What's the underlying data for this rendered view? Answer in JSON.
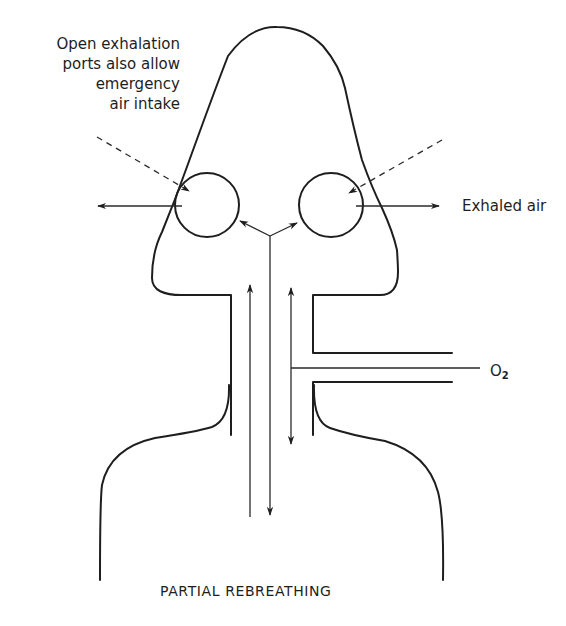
{
  "diagram": {
    "title": "PARTIAL REBREATHING",
    "labels": {
      "ports_note": [
        "Open exhalation",
        "ports also allow",
        "emergency",
        "air intake"
      ],
      "exhaled_air": "Exhaled air",
      "oxygen_main": "O",
      "oxygen_sub": "2"
    },
    "components": [
      {
        "name": "head-outline",
        "description": "Face mask / head silhouette"
      },
      {
        "name": "left-exhalation-port",
        "description": "Circular port on left side"
      },
      {
        "name": "right-exhalation-port",
        "description": "Circular port on right side"
      },
      {
        "name": "neck-tube",
        "description": "Central breathing tube"
      },
      {
        "name": "oxygen-inlet",
        "description": "Side inlet tube carrying O2"
      },
      {
        "name": "shoulders-outline",
        "description": "Shoulders / reservoir bag outline"
      }
    ],
    "flows": [
      {
        "name": "exhaled-air-left",
        "direction": "outward-left"
      },
      {
        "name": "exhaled-air-right",
        "direction": "outward-right"
      },
      {
        "name": "emergency-intake-left",
        "style": "dashed",
        "direction": "inward"
      },
      {
        "name": "emergency-intake-right",
        "style": "dashed",
        "direction": "inward"
      },
      {
        "name": "central-up-flow",
        "direction": "up"
      },
      {
        "name": "central-down-flow",
        "direction": "down"
      },
      {
        "name": "right-bidirectional-flow",
        "direction": "up-down"
      },
      {
        "name": "split-to-ports",
        "direction": "up-left and up-right"
      }
    ],
    "colors": {
      "line": "#1e1e1e",
      "background": "#ffffff"
    }
  }
}
